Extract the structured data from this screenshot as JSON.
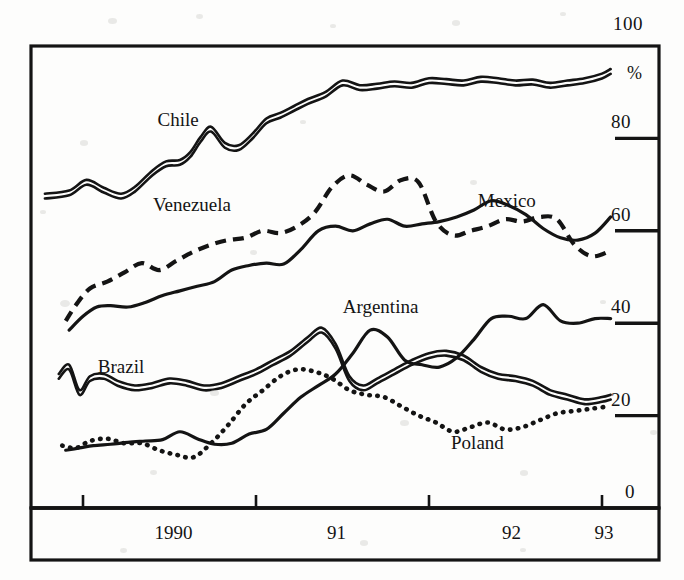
{
  "chart_data": {
    "type": "line",
    "title": "",
    "subtitle": "",
    "xlabel": "",
    "ylabel": "%",
    "unit_label": "%",
    "grid": false,
    "legend_position": "inline-labels",
    "xlim": [
      1989.75,
      1993.1
    ],
    "ylim": [
      0,
      100
    ],
    "y_ticks": [
      0,
      20,
      40,
      60,
      80,
      100
    ],
    "y_tick_labels": [
      "0",
      "20",
      "40",
      "60",
      "80",
      "100"
    ],
    "x_ticks": [
      1990,
      1991,
      1992,
      1993
    ],
    "x_tick_labels": [
      "1990",
      "91",
      "92",
      "93"
    ],
    "series": [
      {
        "name": "Chile",
        "style": "double-solid",
        "label_x": 1990.55,
        "label_y": 84.0,
        "x": [
          1989.78,
          1989.92,
          1990.02,
          1990.12,
          1990.22,
          1990.3,
          1990.4,
          1990.48,
          1990.56,
          1990.62,
          1990.68,
          1990.74,
          1990.82,
          1990.9,
          1990.98,
          1991.06,
          1991.14,
          1991.22,
          1991.3,
          1991.4,
          1991.5,
          1991.6,
          1991.7,
          1991.8,
          1991.9,
          1992.0,
          1992.1,
          1992.2,
          1992.3,
          1992.4,
          1992.5,
          1992.6,
          1992.7,
          1992.8,
          1992.9,
          1993.0,
          1993.05
        ],
        "values": [
          67.5,
          68.2,
          70.5,
          68.8,
          67.5,
          69.0,
          72.5,
          74.5,
          74.8,
          76.5,
          79.8,
          82.0,
          78.5,
          78.0,
          80.5,
          83.8,
          85.0,
          86.5,
          88.0,
          89.5,
          92.0,
          91.0,
          91.3,
          91.8,
          91.5,
          92.5,
          92.3,
          92.0,
          92.8,
          92.5,
          92.0,
          92.2,
          91.5,
          92.0,
          92.5,
          93.5,
          94.5
        ]
      },
      {
        "name": "Venezuela",
        "style": "dashed",
        "label_x": 1990.63,
        "label_y": 65.5,
        "x": [
          1989.9,
          1989.96,
          1990.04,
          1990.14,
          1990.24,
          1990.34,
          1990.44,
          1990.54,
          1990.64,
          1990.74,
          1990.84,
          1990.94,
          1991.04,
          1991.14,
          1991.24,
          1991.34,
          1991.44,
          1991.54,
          1991.64,
          1991.74,
          1991.84,
          1991.94,
          1992.04,
          1992.14,
          1992.24,
          1992.34,
          1992.44,
          1992.54,
          1992.64,
          1992.74,
          1992.84,
          1992.94,
          1993.04
        ],
        "values": [
          40.5,
          44.0,
          47.5,
          49.0,
          51.0,
          53.0,
          51.5,
          53.5,
          55.5,
          57.0,
          58.0,
          58.5,
          60.0,
          59.5,
          61.0,
          64.0,
          69.5,
          72.0,
          70.0,
          68.5,
          71.0,
          70.5,
          62.0,
          59.0,
          60.0,
          61.0,
          62.5,
          62.0,
          63.0,
          62.5,
          57.0,
          54.5,
          55.5
        ]
      },
      {
        "name": "Mexico",
        "style": "solid",
        "label_x": 1992.45,
        "label_y": 66.5,
        "x": [
          1989.92,
          1990.0,
          1990.08,
          1990.16,
          1990.26,
          1990.36,
          1990.46,
          1990.56,
          1990.66,
          1990.76,
          1990.86,
          1990.96,
          1991.06,
          1991.16,
          1991.26,
          1991.36,
          1991.46,
          1991.56,
          1991.66,
          1991.76,
          1991.86,
          1991.96,
          1992.06,
          1992.16,
          1992.26,
          1992.36,
          1992.46,
          1992.56,
          1992.66,
          1992.76,
          1992.86,
          1992.96,
          1993.05
        ],
        "values": [
          38.5,
          41.5,
          43.5,
          43.8,
          43.5,
          44.5,
          46.0,
          47.0,
          48.0,
          49.0,
          51.5,
          52.5,
          53.0,
          52.8,
          56.0,
          60.0,
          61.0,
          60.0,
          61.5,
          62.5,
          61.0,
          61.5,
          62.0,
          63.0,
          64.5,
          66.5,
          65.5,
          63.5,
          60.5,
          58.5,
          58.0,
          59.5,
          63.0
        ]
      },
      {
        "name": "Argentina",
        "style": "solid",
        "label_x": 1991.72,
        "label_y": 43.5,
        "x": [
          1989.9,
          1989.98,
          1990.06,
          1990.16,
          1990.26,
          1990.36,
          1990.46,
          1990.56,
          1990.66,
          1990.76,
          1990.86,
          1990.96,
          1991.06,
          1991.16,
          1991.26,
          1991.36,
          1991.46,
          1991.56,
          1991.66,
          1991.76,
          1991.86,
          1991.96,
          1992.06,
          1992.16,
          1992.26,
          1992.36,
          1992.46,
          1992.56,
          1992.66,
          1992.76,
          1992.86,
          1992.96,
          1993.05
        ],
        "values": [
          12.5,
          13.0,
          13.5,
          13.8,
          14.2,
          14.5,
          14.8,
          16.5,
          15.0,
          13.8,
          14.0,
          16.0,
          17.0,
          20.5,
          24.0,
          26.5,
          29.0,
          33.5,
          38.5,
          37.0,
          32.0,
          31.0,
          30.5,
          32.5,
          36.5,
          41.0,
          41.5,
          41.0,
          44.0,
          40.5,
          40.0,
          41.0,
          41.0
        ]
      },
      {
        "name": "Brazil",
        "style": "double-solid",
        "label_x": 1990.22,
        "label_y": 30.5,
        "x": [
          1989.86,
          1989.92,
          1989.98,
          1990.04,
          1990.12,
          1990.2,
          1990.3,
          1990.4,
          1990.5,
          1990.6,
          1990.7,
          1990.8,
          1990.9,
          1991.0,
          1991.1,
          1991.2,
          1991.3,
          1991.38,
          1991.46,
          1991.54,
          1991.62,
          1991.7,
          1991.8,
          1991.9,
          1992.0,
          1992.1,
          1992.2,
          1992.3,
          1992.4,
          1992.5,
          1992.6,
          1992.7,
          1992.8,
          1992.9,
          1993.0,
          1993.05
        ],
        "values": [
          28.5,
          30.5,
          25.0,
          28.0,
          28.5,
          27.0,
          26.0,
          26.5,
          27.5,
          27.0,
          26.0,
          26.5,
          28.0,
          29.5,
          31.5,
          33.5,
          36.5,
          38.5,
          35.0,
          28.0,
          26.0,
          27.5,
          29.5,
          31.5,
          33.0,
          33.5,
          32.5,
          30.0,
          28.5,
          28.0,
          27.0,
          25.0,
          24.0,
          23.0,
          23.5,
          24.0
        ]
      },
      {
        "name": "Poland",
        "style": "dotted",
        "label_x": 1992.28,
        "label_y": 14.0,
        "x": [
          1989.88,
          1989.96,
          1990.04,
          1990.14,
          1990.24,
          1990.34,
          1990.44,
          1990.54,
          1990.64,
          1990.74,
          1990.84,
          1990.94,
          1991.04,
          1991.14,
          1991.24,
          1991.34,
          1991.44,
          1991.54,
          1991.64,
          1991.74,
          1991.84,
          1991.94,
          1992.04,
          1992.14,
          1992.24,
          1992.34,
          1992.44,
          1992.54,
          1992.64,
          1992.74,
          1992.84,
          1992.94,
          1993.04
        ],
        "values": [
          13.5,
          13.0,
          14.5,
          15.0,
          14.0,
          14.0,
          12.5,
          11.5,
          11.0,
          14.0,
          18.0,
          22.5,
          25.5,
          28.5,
          30.0,
          29.5,
          28.0,
          25.5,
          24.5,
          24.0,
          22.0,
          20.0,
          18.5,
          16.5,
          17.5,
          18.5,
          17.0,
          17.5,
          19.0,
          20.5,
          21.0,
          21.5,
          22.0
        ]
      }
    ]
  },
  "axis": {
    "unit": "%",
    "y_labels": [
      {
        "text": "100",
        "value": 100
      },
      {
        "text": "80",
        "value": 80
      },
      {
        "text": "60",
        "value": 60
      },
      {
        "text": "40",
        "value": 40
      },
      {
        "text": "20",
        "value": 20
      },
      {
        "text": "0",
        "value": 0
      }
    ],
    "x_labels": [
      {
        "text": "1990",
        "value": 1990
      },
      {
        "text": "91",
        "value": 1991
      },
      {
        "text": "92",
        "value": 1992
      },
      {
        "text": "93",
        "value": 1993
      }
    ]
  },
  "series_labels": [
    {
      "name": "Chile"
    },
    {
      "name": "Venezuela"
    },
    {
      "name": "Mexico"
    },
    {
      "name": "Argentina"
    },
    {
      "name": "Brazil"
    },
    {
      "name": "Poland"
    }
  ],
  "colors": {
    "ink": "#141414",
    "paper": "#fdfdfc"
  }
}
